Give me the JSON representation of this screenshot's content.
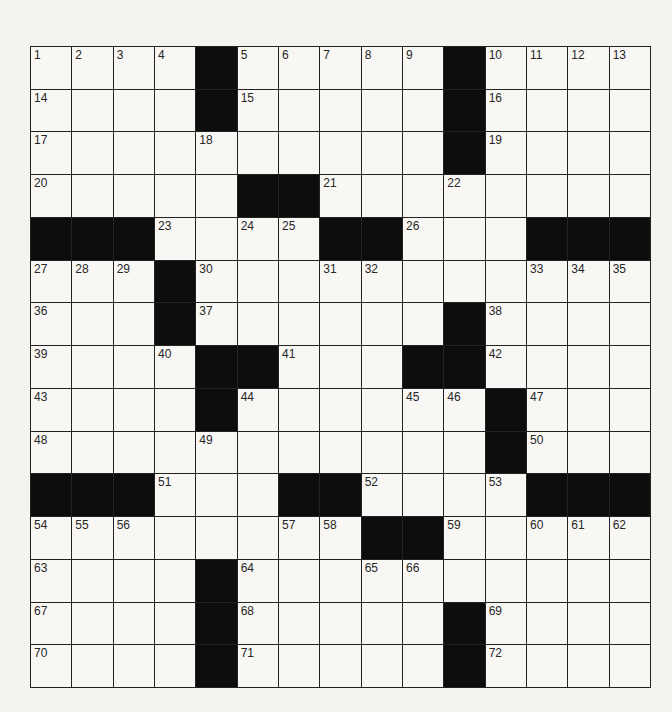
{
  "puzzle": {
    "rows": 15,
    "cols": 15,
    "colors": {
      "block": "#0d0d0d",
      "cell": "#f8f7f4",
      "line": "#222222",
      "background": "#f4f3f0"
    },
    "grid": [
      [
        "1",
        "2",
        "3",
        "4",
        "#",
        "5",
        "6",
        "7",
        "8",
        "9",
        "#",
        "10",
        "11",
        "12",
        "13"
      ],
      [
        "14",
        "",
        "",
        "",
        "#",
        "15",
        "",
        "",
        "",
        "",
        "#",
        "16",
        "",
        "",
        ""
      ],
      [
        "17",
        "",
        "",
        "",
        "18",
        "",
        "",
        "",
        "",
        "",
        "#",
        "19",
        "",
        "",
        ""
      ],
      [
        "20",
        "",
        "",
        "",
        "",
        "#",
        "#",
        "21",
        "",
        "",
        "22",
        "",
        "",
        "",
        ""
      ],
      [
        "#",
        "#",
        "#",
        "23",
        "",
        "24",
        "25",
        "#",
        "#",
        "26",
        "",
        "",
        "#",
        "#",
        "#"
      ],
      [
        "27",
        "28",
        "29",
        "#",
        "30",
        "",
        "",
        "31",
        "32",
        "",
        "",
        "",
        "33",
        "34",
        "35"
      ],
      [
        "36",
        "",
        "",
        "#",
        "37",
        "",
        "",
        "",
        "",
        "",
        "#",
        "38",
        "",
        "",
        ""
      ],
      [
        "39",
        "",
        "",
        "40",
        "#",
        "#",
        "41",
        "",
        "",
        "#",
        "#",
        "42",
        "",
        "",
        ""
      ],
      [
        "43",
        "",
        "",
        "",
        "#",
        "44",
        "",
        "",
        "",
        "45",
        "46",
        "#",
        "47",
        "",
        ""
      ],
      [
        "48",
        "",
        "",
        "",
        "49",
        "",
        "",
        "",
        "",
        "",
        "",
        "#",
        "50",
        "",
        ""
      ],
      [
        "#",
        "#",
        "#",
        "51",
        "",
        "",
        "#",
        "#",
        "52",
        "",
        "",
        "53",
        "#",
        "#",
        "#"
      ],
      [
        "54",
        "55",
        "56",
        "",
        "",
        "",
        "57",
        "58",
        "#",
        "#",
        "59",
        "",
        "60",
        "61",
        "62"
      ],
      [
        "63",
        "",
        "",
        "",
        "#",
        "64",
        "",
        "",
        "65",
        "66",
        "",
        "",
        "",
        "",
        ""
      ],
      [
        "67",
        "",
        "",
        "",
        "#",
        "68",
        "",
        "",
        "",
        "",
        "#",
        "69",
        "",
        "",
        ""
      ],
      [
        "70",
        "",
        "",
        "",
        "#",
        "71",
        "",
        "",
        "",
        "",
        "#",
        "72",
        "",
        "",
        ""
      ]
    ]
  }
}
